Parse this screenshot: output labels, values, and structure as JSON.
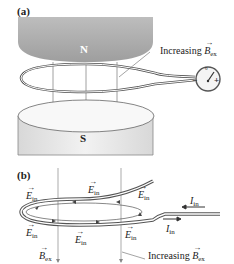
{
  "panel_a": {
    "label": "(a)",
    "north_pole": "N",
    "south_pole": "S",
    "annotation": {
      "prefix": "Increasing ",
      "symbol": "B",
      "subscript": "ex"
    },
    "meter": {
      "minus": "−",
      "plus": "+",
      "zero": "0"
    }
  },
  "panel_b": {
    "label": "(b)",
    "field_label": {
      "symbol": "E",
      "subscript": "in"
    },
    "current_label": {
      "symbol": "I",
      "subscript": "in"
    },
    "b_label": {
      "symbol": "B",
      "subscript": "ex"
    },
    "annotation": {
      "prefix": "Increasing ",
      "symbol": "B",
      "subscript": "ex"
    }
  },
  "colors": {
    "magnet_n": "#a9a9a9",
    "magnet_s": "#e6e6e6",
    "wire": "#555555",
    "field_line": "#888888"
  }
}
